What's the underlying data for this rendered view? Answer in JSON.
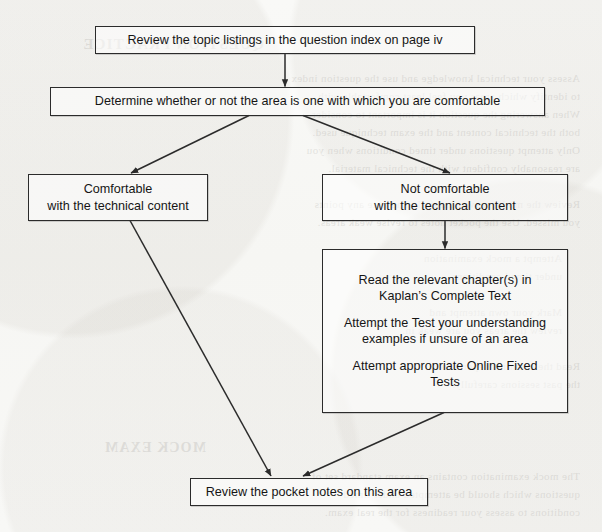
{
  "diagram": {
    "type": "flowchart",
    "paper_color": "#f8f8f6",
    "ink_color": "#1a1a1a",
    "border_color": "#2b2b2b",
    "nodes": [
      {
        "id": "review-topic-listings",
        "lines": [
          "Review the topic listings in the question index on page iv"
        ]
      },
      {
        "id": "determine-comfortable",
        "lines": [
          "Determine whether or not the area is one with which you are comfortable"
        ]
      },
      {
        "id": "comfortable",
        "lines": [
          "Comfortable",
          "with the technical content"
        ]
      },
      {
        "id": "not-comfortable",
        "lines": [
          "Not comfortable",
          "with the technical content"
        ]
      },
      {
        "id": "study-actions",
        "blocks": [
          [
            "Read the relevant chapter(s) in",
            "Kaplan’s Complete Text"
          ],
          [
            "Attempt the Test your understanding",
            "examples if unsure of an area"
          ],
          [
            "Attempt appropriate Online Fixed",
            "Tests"
          ]
        ]
      },
      {
        "id": "review-pocket-notes",
        "lines": [
          "Review the pocket notes on this area"
        ]
      }
    ]
  },
  "bleed_through": {
    "note": "faint mirror-image show-through text from the reverse of the scanned page",
    "lines": [
      {
        "text": "QUESTION PRACTICE",
        "x": 338,
        "y": 36,
        "head": true,
        "size": 15
      },
      {
        "text": "Assess your technical knowledge and use the question index",
        "x": 22,
        "y": 72,
        "size": 11
      },
      {
        "text": "to identify which areas you feel least comfortable with.",
        "x": 22,
        "y": 90,
        "size": 11
      },
      {
        "text": "When answering the question it is important to consider",
        "x": 22,
        "y": 108,
        "size": 11
      },
      {
        "text": "both the technical content and the exam technique used.",
        "x": 22,
        "y": 126,
        "size": 11
      },
      {
        "text": "Only attempt questions under timed conditions when you",
        "x": 22,
        "y": 144,
        "size": 11
      },
      {
        "text": "are reasonably confident with the technical material.",
        "x": 22,
        "y": 162,
        "size": 11
      },
      {
        "text": "Review the model answer carefully and note any points",
        "x": 22,
        "y": 198,
        "size": 11
      },
      {
        "text": "you missed. Use the pocket notes to revise weak areas.",
        "x": 22,
        "y": 216,
        "size": 11
      },
      {
        "text": "Attempt a mock examination",
        "x": 40,
        "y": 252,
        "size": 11
      },
      {
        "text": "under timed conditions",
        "x": 40,
        "y": 270,
        "size": 11
      },
      {
        "text": "Mark your own attempt and",
        "x": 40,
        "y": 306,
        "size": 11
      },
      {
        "text": "review the areas you are weak in.",
        "x": 40,
        "y": 324,
        "size": 11
      },
      {
        "text": "Read the examiner reports for",
        "x": 22,
        "y": 360,
        "size": 11
      },
      {
        "text": "the past sessions carefully.",
        "x": 22,
        "y": 378,
        "size": 11
      },
      {
        "text": "MOCK EXAM",
        "x": 396,
        "y": 440,
        "head": true,
        "size": 14
      },
      {
        "text": "The mock examination contains an exam standard set of",
        "x": 22,
        "y": 470,
        "size": 11
      },
      {
        "text": "questions which should be attempted under timed",
        "x": 22,
        "y": 488,
        "size": 11
      },
      {
        "text": "conditions to assess your readiness for the real exam.",
        "x": 22,
        "y": 506,
        "size": 11
      }
    ]
  }
}
